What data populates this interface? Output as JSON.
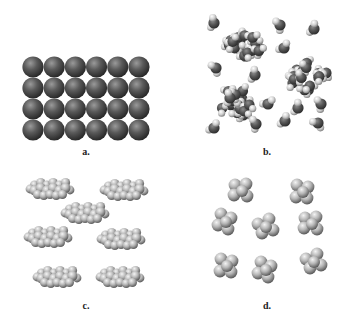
{
  "figure": {
    "panels": [
      {
        "id": "a",
        "label": "a.",
        "label_pos": [
          86,
          146
        ],
        "description": "regular close-packed lattice of identical atoms (solid)",
        "sphere_color": "dark",
        "grid": {
          "cols": 6,
          "rows": 4,
          "x0": 33,
          "y0": 67,
          "dx": 21.2,
          "dy": 21,
          "r": 10.6
        }
      },
      {
        "id": "b",
        "label": "b.",
        "label_pos": [
          267,
          146
        ],
        "description": "water molecules, some isolated and some in clusters (liquid)",
        "molecules": [
          [
            214,
            23,
            0.2
          ],
          [
            280,
            25,
            -0.4
          ],
          [
            314,
            29,
            0.5
          ],
          [
            284,
            48,
            0.9
          ],
          [
            216,
            68,
            -0.6
          ],
          [
            255,
            75,
            0.3
          ],
          [
            230,
            98,
            0.1
          ],
          [
            268,
            104,
            1.2
          ],
          [
            298,
            108,
            0.4
          ],
          [
            321,
            104,
            -0.3
          ],
          [
            214,
            128,
            0.8
          ],
          [
            256,
            124,
            -0.2
          ],
          [
            285,
            121,
            0.6
          ],
          [
            318,
            123,
            -0.9
          ]
        ],
        "clusters": [
          {
            "cx": 243,
            "cy": 44,
            "rx": 22,
            "ry": 17
          },
          {
            "cx": 307,
            "cy": 76,
            "rx": 24,
            "ry": 19
          },
          {
            "cx": 236,
            "cy": 104,
            "rx": 18,
            "ry": 19
          }
        ]
      },
      {
        "id": "c",
        "label": "c.",
        "label_pos": [
          86,
          300
        ],
        "description": "chain hydrocarbon molecules (alkanes)",
        "molecules": [
          [
            50,
            189,
            6
          ],
          [
            124,
            190,
            6
          ],
          [
            85,
            213,
            6
          ],
          [
            48,
            237,
            6
          ],
          [
            121,
            239,
            6
          ],
          [
            57,
            277,
            6
          ],
          [
            120,
            277,
            6
          ]
        ]
      },
      {
        "id": "d",
        "label": "d.",
        "label_pos": [
          267,
          300
        ],
        "description": "compact tetrahedral molecules",
        "molecules": [
          [
            241,
            190
          ],
          [
            302,
            191
          ],
          [
            225,
            221
          ],
          [
            265,
            226
          ],
          [
            311,
            223
          ],
          [
            226,
            265
          ],
          [
            265,
            269
          ],
          [
            313,
            261
          ]
        ]
      }
    ]
  },
  "colors": {
    "background": "#ffffff",
    "dark_sphere_light": "#8a8a8a",
    "dark_sphere_mid": "#4f4f4f",
    "dark_sphere_edge": "#2a2a2a",
    "oxygen_light": "#7a7a7a",
    "oxygen_edge": "#2e2e2e",
    "hydrogen_light": "#f2f2f2",
    "hydrogen_edge": "#8c8c8c",
    "carbon_light": "#e6e6e6",
    "carbon_edge": "#6a6a6a",
    "label": "#222222"
  }
}
